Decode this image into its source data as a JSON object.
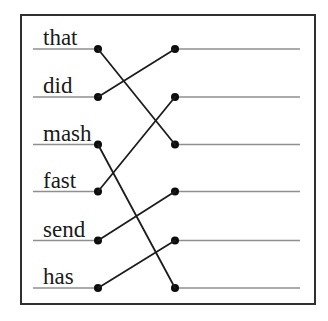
{
  "figure": {
    "type": "matching-exercise",
    "words": [
      "that",
      "did",
      "mash",
      "fast",
      "send",
      "has"
    ],
    "answer_slots": [
      "",
      "",
      "",
      "",
      "",
      ""
    ],
    "connections": [
      {
        "from_word": "that",
        "from_index": 0,
        "to_slot_index": 2
      },
      {
        "from_word": "did",
        "from_index": 1,
        "to_slot_index": 0
      },
      {
        "from_word": "mash",
        "from_index": 2,
        "to_slot_index": 5
      },
      {
        "from_word": "fast",
        "from_index": 3,
        "to_slot_index": 1
      },
      {
        "from_word": "send",
        "from_index": 4,
        "to_slot_index": 3
      },
      {
        "from_word": "has",
        "from_index": 5,
        "to_slot_index": 4
      }
    ],
    "colors": {
      "background": "#ffffff",
      "border": "#303030",
      "guide_line": "#8f8f8f",
      "connector_line": "#1d1d1d",
      "dot": "#0d0d0d",
      "text": "#1a1a1a"
    }
  }
}
